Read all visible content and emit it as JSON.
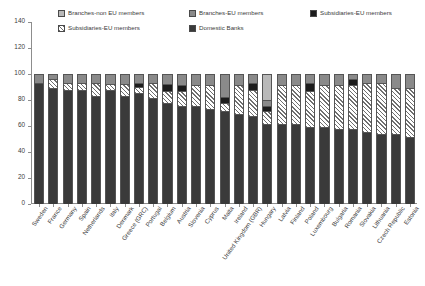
{
  "chart_data": {
    "type": "bar",
    "subtype": "stacked",
    "title": "",
    "subtitle": "",
    "xlabel": "",
    "ylabel": "",
    "ylim": [
      0,
      140
    ],
    "yticks": [
      0,
      20,
      40,
      60,
      80,
      100,
      120,
      140
    ],
    "grid": false,
    "legend_position": "top",
    "legend": [
      "Branches-non EU members",
      "Branches-EU members",
      "Subsidiaries-EU members",
      "Subsidiaries-EU members",
      "Domestic Banks"
    ],
    "colors": {
      "branches_non_eu": "#b9b9b9",
      "branches_eu": "#8a8a8a",
      "subsidiaries_eu_solid": "#1c1c1c",
      "subsidiaries_eu_hatch": "#6f6f6f",
      "domestic_banks": "#3a3a3a",
      "axis": "#8d8d8d",
      "text": "#3a3a3a"
    },
    "categories": [
      "Sweden",
      "France",
      "Germany",
      "Spain",
      "Netherlands",
      "Italy",
      "Denmark",
      "Greece (GRC)",
      "Portugal",
      "Belgium",
      "Austria",
      "Slovenia",
      "Cyprus",
      "Malta",
      "Ireland",
      "United Kingdom (GBR)",
      "Hungary",
      "Latvia",
      "Finland",
      "Poland",
      "Luxembourg",
      "Bulgaria",
      "Romania",
      "Slovakia",
      "Lithuania",
      "Czech Republic",
      "Estonia"
    ],
    "series": [
      {
        "name": "Domestic Banks",
        "key": "domestic",
        "values": [
          94,
          90,
          88,
          88,
          84,
          88,
          84,
          86,
          82,
          78,
          76,
          76,
          74,
          72,
          70,
          68,
          62,
          62,
          62,
          60,
          60,
          58,
          58,
          56,
          54,
          54,
          52
        ]
      },
      {
        "name": "Subsidiaries-EU members",
        "key": "subs_hatch",
        "values": [
          0,
          7,
          6,
          6,
          10,
          5,
          9,
          5,
          12,
          10,
          12,
          16,
          18,
          6,
          22,
          20,
          10,
          30,
          30,
          28,
          32,
          34,
          34,
          38,
          40,
          36,
          38
        ]
      },
      {
        "name": "Subsidiaries-EU members",
        "key": "subs_solid",
        "values": [
          0,
          0,
          0,
          0,
          0,
          0,
          0,
          3,
          0,
          5,
          4,
          0,
          0,
          5,
          0,
          6,
          4,
          0,
          0,
          6,
          0,
          0,
          5,
          0,
          0,
          0,
          0
        ]
      },
      {
        "name": "Branches-EU members",
        "key": "branches_eu",
        "values": [
          6,
          3,
          6,
          6,
          6,
          7,
          7,
          6,
          6,
          7,
          8,
          8,
          8,
          17,
          8,
          6,
          5,
          8,
          8,
          6,
          8,
          8,
          3,
          6,
          6,
          10,
          10
        ]
      },
      {
        "name": "Branches-non EU members",
        "key": "branches_non_eu",
        "values": [
          0,
          0,
          0,
          0,
          0,
          0,
          0,
          0,
          0,
          0,
          0,
          0,
          0,
          0,
          0,
          0,
          19,
          0,
          0,
          0,
          0,
          0,
          0,
          0,
          0,
          0,
          0
        ]
      }
    ]
  },
  "legend": {
    "items": [
      {
        "label": "Branches-non EU members",
        "style": "fill-branches-non-eu",
        "name": "legend-branches-non-eu"
      },
      {
        "label": "Branches-EU members",
        "style": "fill-branches-eu",
        "name": "legend-branches-eu"
      },
      {
        "label": "Subsidiaries-EU members",
        "style": "fill-subs-eu-solid",
        "name": "legend-subsidiaries-eu-solid"
      },
      {
        "label": "Subsidiaries-EU members",
        "style": "fill-subs-eu-hatch",
        "name": "legend-subsidiaries-eu-hatch"
      },
      {
        "label": "Domestic Banks",
        "style": "fill-domestic",
        "name": "legend-domestic-banks"
      }
    ]
  }
}
